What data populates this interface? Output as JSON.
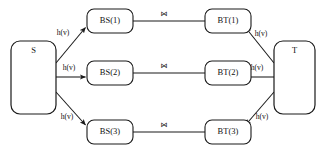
{
  "diagram": {
    "colors": {
      "background": "#ffffff",
      "stroke": "#1a1a1a",
      "text": "#111111"
    },
    "endpoints": {
      "source": {
        "label": "S",
        "name": "source-node"
      },
      "target": {
        "label": "T",
        "name": "target-node"
      }
    },
    "source_nodes": [
      {
        "label": "BS(1)"
      },
      {
        "label": "BS(2)"
      },
      {
        "label": "BS(3)"
      }
    ],
    "target_nodes": [
      {
        "label": "BT(1)"
      },
      {
        "label": "BT(2)"
      },
      {
        "label": "BT(3)"
      }
    ],
    "source_edge_labels": [
      {
        "label": "h(v)"
      },
      {
        "label": "h(v)"
      },
      {
        "label": "h(v)"
      }
    ],
    "target_edge_labels": [
      {
        "label": "h(v)"
      },
      {
        "label": "h(v)"
      },
      {
        "label": "h(v)"
      }
    ],
    "join_symbols": [
      {
        "label": "⋈"
      },
      {
        "label": "⋈"
      },
      {
        "label": "⋈"
      }
    ]
  }
}
